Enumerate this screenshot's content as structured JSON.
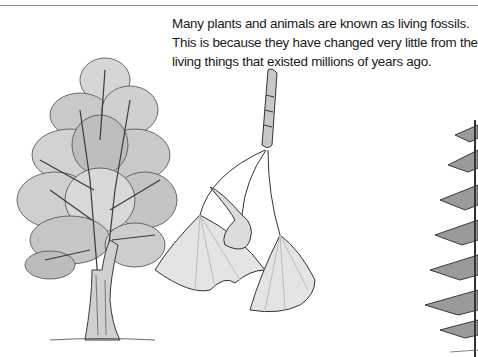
{
  "page": {
    "caption": "Many plants and animals are known as living fossils. This is because they have changed very little from the living things that existed millions of years ago."
  },
  "illustrations": [
    {
      "name": "ginkgo-tree",
      "description": "Pencil illustration of a tall ginkgo tree"
    },
    {
      "name": "ginkgo-leaf-branch",
      "description": "Ginkgo twig with three fan-shaped leaves"
    },
    {
      "name": "conifer-tree-partial",
      "description": "Partially visible conifer tree at right edge"
    }
  ],
  "colors": {
    "text": "#1a1a1a",
    "rule": "#8a8a8a",
    "ink": "#3a3a3a",
    "shade": "#b8b8b8",
    "leaf_fill": "#e4e4e4"
  }
}
